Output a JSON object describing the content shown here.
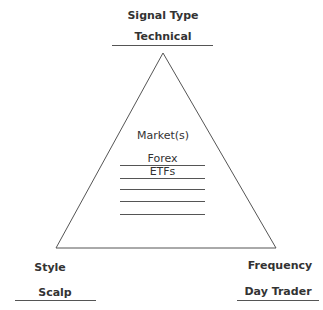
{
  "diagram": {
    "top": {
      "heading": "Signal Type",
      "value": "Technical"
    },
    "center": {
      "heading": "Market(s)",
      "items": [
        "Forex",
        "ETFs",
        "",
        "",
        ""
      ]
    },
    "bottom_left": {
      "heading": "Style",
      "value": "Scalp"
    },
    "bottom_right": {
      "heading": "Frequency",
      "value": "Day Trader"
    },
    "colors": {
      "line": "#555555",
      "text": "#333333",
      "background": "#ffffff"
    }
  }
}
